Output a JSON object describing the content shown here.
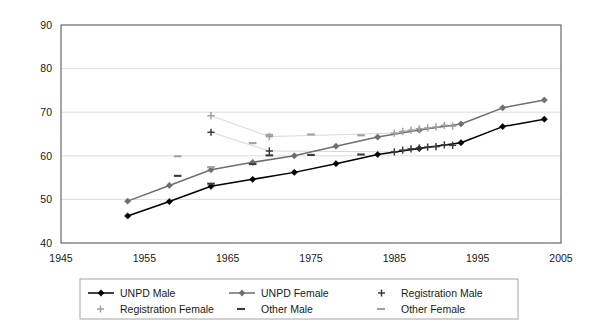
{
  "chart_data": {
    "type": "line",
    "title": "",
    "subtitle": "",
    "xlabel": "",
    "ylabel": "",
    "xlim": [
      1945,
      2005
    ],
    "ylim": [
      40,
      90
    ],
    "xticks": [
      1945,
      1955,
      1965,
      1975,
      1985,
      1995,
      2005
    ],
    "yticks": [
      40,
      50,
      60,
      70,
      80,
      90
    ],
    "grid": "horizontal",
    "legend_position": "bottom",
    "colors": {
      "unpd_male": "#000000",
      "unpd_female": "#6e6e6e",
      "registration_male": "#3a3a3a",
      "registration_female": "#a0a0a0",
      "other_male": "#3a3a3a",
      "other_female": "#a0a0a0",
      "gridline": "#d9d9d9",
      "axis": "#5a5a5a"
    },
    "series": [
      {
        "name": "UNPD Male",
        "marker": "diamond",
        "style": "line-marker",
        "color": "#000000",
        "x": [
          1953,
          1958,
          1963,
          1968,
          1973,
          1978,
          1983,
          1988,
          1993,
          1998,
          2003
        ],
        "y": [
          46.2,
          49.5,
          53.0,
          54.6,
          56.2,
          58.2,
          60.3,
          61.7,
          63.0,
          66.7,
          68.4
        ]
      },
      {
        "name": "UNPD Female",
        "marker": "diamond",
        "style": "line-marker",
        "color": "#6e6e6e",
        "x": [
          1953,
          1958,
          1963,
          1968,
          1973,
          1978,
          1983,
          1988,
          1993,
          1998,
          2003
        ],
        "y": [
          49.6,
          53.2,
          56.8,
          58.5,
          60.0,
          62.2,
          64.3,
          65.9,
          67.3,
          71.0,
          72.8
        ]
      },
      {
        "name": "Registration Male",
        "marker": "plus",
        "style": "markers-faintline",
        "color": "#3a3a3a",
        "x": [
          1963,
          1970,
          1985,
          1986,
          1987,
          1988,
          1989,
          1990,
          1991,
          1992
        ],
        "y": [
          65.4,
          61.1,
          60.9,
          61.3,
          61.6,
          61.8,
          62.0,
          62.1,
          62.5,
          62.4
        ]
      },
      {
        "name": "Registration Female",
        "marker": "plus",
        "style": "markers-faintline",
        "color": "#a0a0a0",
        "x": [
          1963,
          1970,
          1985,
          1986,
          1987,
          1988,
          1989,
          1990,
          1991,
          1992
        ],
        "y": [
          69.2,
          64.4,
          65.2,
          65.6,
          65.9,
          66.2,
          66.4,
          66.6,
          67.0,
          66.8
        ]
      },
      {
        "name": "Other Male",
        "marker": "dash",
        "style": "markers-only",
        "color": "#3a3a3a",
        "x": [
          1959,
          1963,
          1968,
          1970,
          1975,
          1981
        ],
        "y": [
          55.4,
          53.6,
          58.1,
          60.1,
          60.2,
          60.3
        ]
      },
      {
        "name": "Other Female",
        "marker": "dash",
        "style": "markers-only",
        "color": "#a0a0a0",
        "x": [
          1959,
          1963,
          1968,
          1970,
          1975,
          1981
        ],
        "y": [
          59.9,
          57.4,
          62.9,
          64.8,
          64.9,
          64.7
        ]
      }
    ]
  },
  "axes": {
    "x_tick_labels": [
      "1945",
      "1955",
      "1965",
      "1975",
      "1985",
      "1995",
      "2005"
    ],
    "y_tick_labels": [
      "40",
      "50",
      "60",
      "70",
      "80",
      "90"
    ]
  },
  "legend": {
    "items": [
      {
        "label": "UNPD Male",
        "marker": "line-diamond",
        "color": "#000000"
      },
      {
        "label": "UNPD Female",
        "marker": "line-diamond",
        "color": "#6e6e6e"
      },
      {
        "label": "Registration Male",
        "marker": "plus",
        "color": "#3a3a3a"
      },
      {
        "label": "Registration Female",
        "marker": "plus",
        "color": "#a0a0a0"
      },
      {
        "label": "Other Male",
        "marker": "dash",
        "color": "#3a3a3a"
      },
      {
        "label": "Other Female",
        "marker": "dash",
        "color": "#a0a0a0"
      }
    ]
  }
}
